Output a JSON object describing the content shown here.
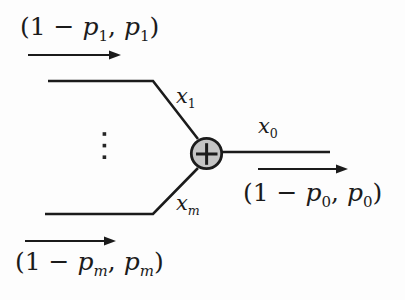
{
  "node": {
    "symbol": "+",
    "fill_color": "#c4c4c4",
    "border_color": "#1b1b1b"
  },
  "colors": {
    "stroke": "#1b1b1b",
    "background": "#fdfdfd",
    "text": "#1b1b1b"
  },
  "icons": {
    "plus": "xor-plus-icon",
    "vdots": "vertical-ellipsis-icon",
    "arrows": "right-arrow-icon"
  },
  "edge_labels": {
    "x1": {
      "base": "x",
      "sub": "1"
    },
    "xm": {
      "base": "x",
      "sub": "m"
    },
    "x0": {
      "base": "x",
      "sub": "0"
    }
  },
  "prob_labels": {
    "top": {
      "open": "(1 − ",
      "var1": "p",
      "sub1": "1",
      "sep": ", ",
      "var2": "p",
      "sub2": "1",
      "close": ")"
    },
    "bottom": {
      "open": "(1 − ",
      "var1": "p",
      "sub1": "m",
      "sep": ", ",
      "var2": "p",
      "sub2": "m",
      "close": ")"
    },
    "output": {
      "open": "(1 − ",
      "var1": "p",
      "sub1": "0",
      "sep": ", ",
      "var2": "p",
      "sub2": "0",
      "close": ")"
    }
  }
}
